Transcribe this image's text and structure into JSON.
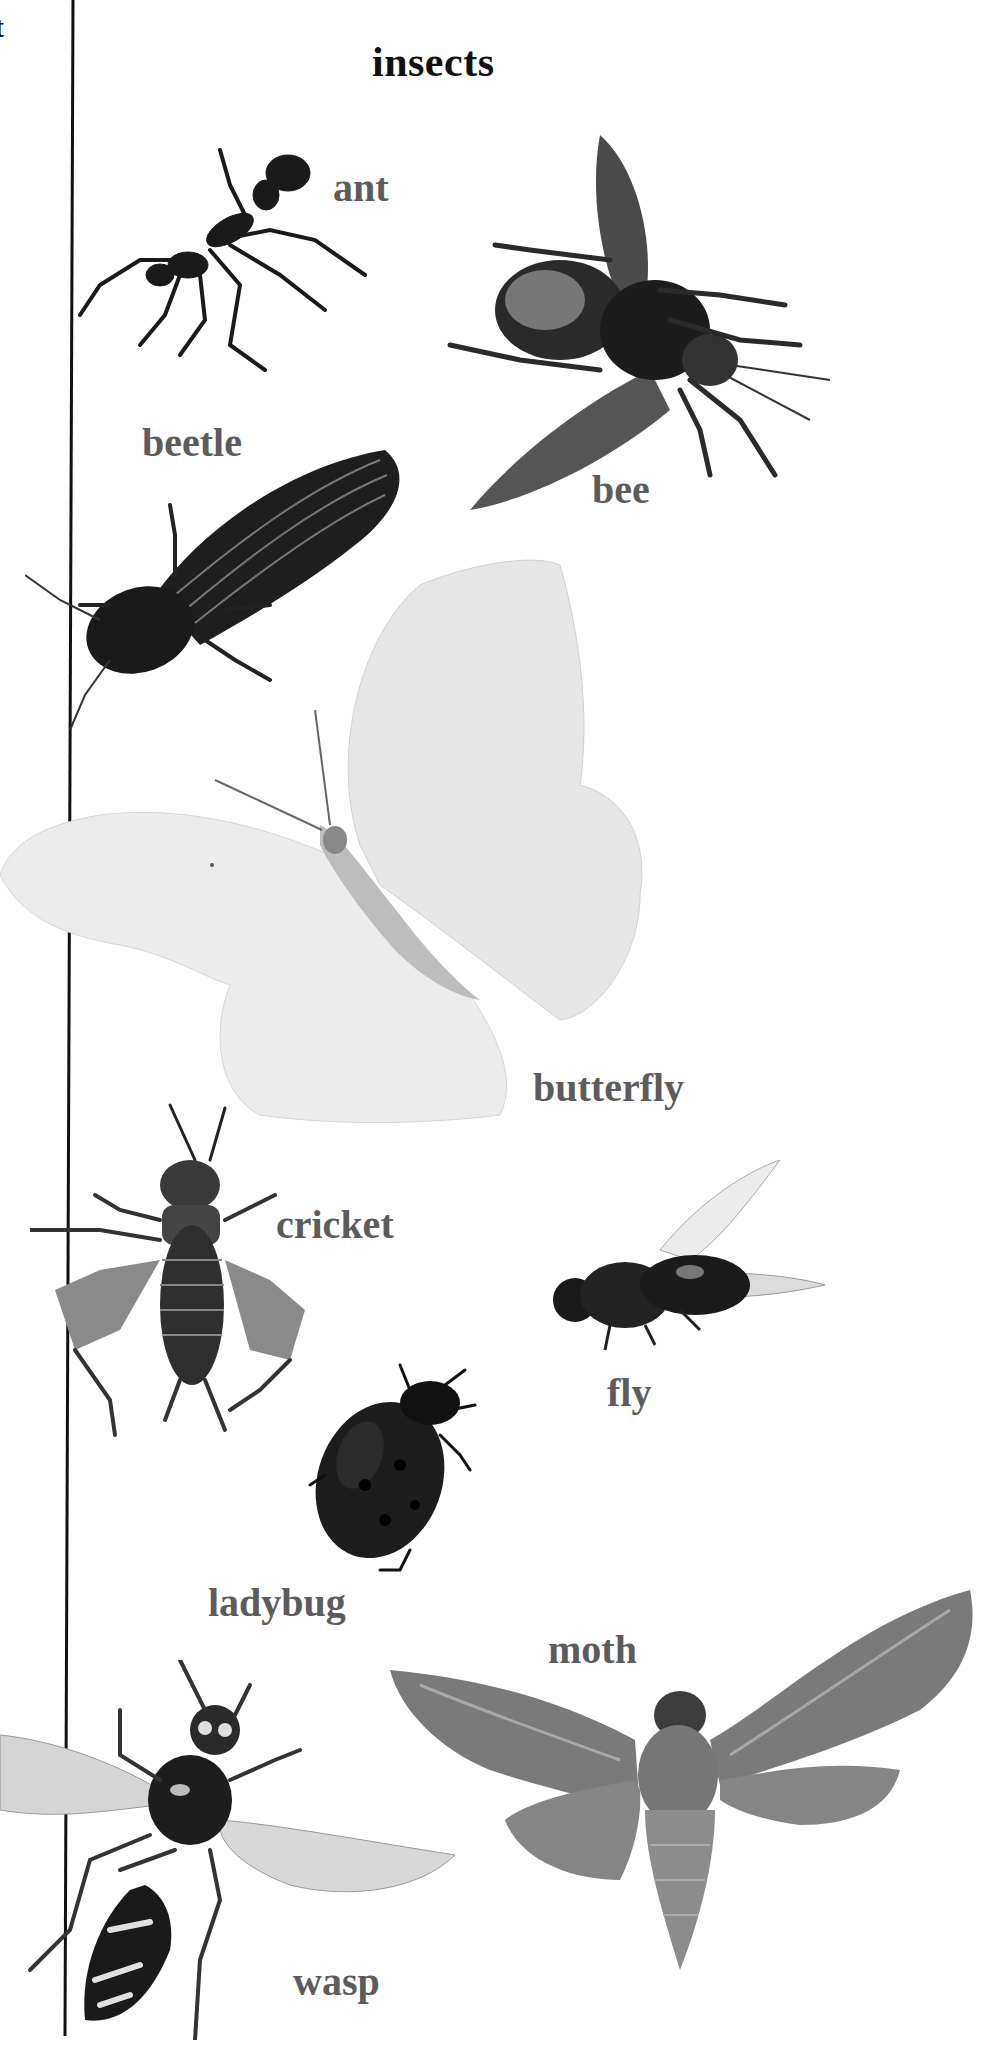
{
  "page": {
    "title": "insects",
    "edge_fragment": "t",
    "colors": {
      "title": "#111111",
      "label": "#5c5c5c",
      "background": "#fefefe",
      "rule": "#111111"
    }
  },
  "insects": [
    {
      "id": "ant",
      "label": "ant"
    },
    {
      "id": "bee",
      "label": "bee"
    },
    {
      "id": "beetle",
      "label": "beetle"
    },
    {
      "id": "butterfly",
      "label": "butterfly"
    },
    {
      "id": "cricket",
      "label": "cricket"
    },
    {
      "id": "fly",
      "label": "fly"
    },
    {
      "id": "ladybug",
      "label": "ladybug"
    },
    {
      "id": "moth",
      "label": "moth"
    },
    {
      "id": "wasp",
      "label": "wasp"
    }
  ]
}
